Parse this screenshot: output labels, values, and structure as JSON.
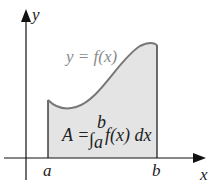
{
  "diagram": {
    "axes": {
      "x_label": "x",
      "y_label": "y"
    },
    "curve_label": "y = f(x)",
    "bounds": {
      "a": "a",
      "b": "b"
    },
    "formula": {
      "lhs": "A =",
      "integral_sign": "∫",
      "upper_limit": "b",
      "lower_limit": "a",
      "integrand": "f(x) dx"
    },
    "colors": {
      "fill": "#e4e4e4",
      "curve": "#777777",
      "axis": "#111111",
      "label": "#8a8a8a"
    }
  }
}
